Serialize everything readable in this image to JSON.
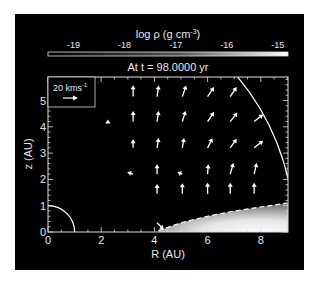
{
  "chart_data": {
    "type": "heatmap",
    "title": "At t = 98.0000 yr",
    "colorbar": {
      "label": "log ρ (g cm⁻³)",
      "label_base": "log ρ (g cm",
      "label_exp": "-3",
      "label_close": ")",
      "ticks": [
        "-19",
        "-18",
        "-17",
        "-16",
        "-15"
      ],
      "range": [
        -19.5,
        -14.8
      ],
      "colormap": "grayscale (black to white)"
    },
    "xlabel": "R (AU)",
    "ylabel": "z (AU)",
    "xlim": [
      0,
      9
    ],
    "ylim": [
      0,
      5.9
    ],
    "xticks": [
      "0",
      "2",
      "4",
      "6",
      "8"
    ],
    "yticks": [
      "0",
      "1",
      "2",
      "3",
      "4",
      "5"
    ],
    "velocity_key": {
      "label": "20 kms",
      "label_exp": "-1",
      "speed_kms": 20
    },
    "overlays": [
      {
        "type": "arc",
        "radius_au": 1.0,
        "style": "solid",
        "color": "#ffffff"
      },
      {
        "type": "arc",
        "radius_au": 9.25,
        "style": "solid",
        "color": "#ffffff"
      },
      {
        "type": "disk-surface",
        "style": "dashed",
        "points_au": [
          [
            4.15,
            0.05
          ],
          [
            5,
            0.35
          ],
          [
            6,
            0.6
          ],
          [
            7,
            0.8
          ],
          [
            8,
            0.95
          ],
          [
            9,
            1.1
          ]
        ]
      }
    ],
    "vectors_au": [
      {
        "R": 2.25,
        "z": 4.15,
        "dR": 0.0,
        "dz": 0.05
      },
      {
        "R": 3.2,
        "z": 5.15,
        "dR": 0.0,
        "dz": 0.35
      },
      {
        "R": 4.1,
        "z": 5.15,
        "dR": 0.05,
        "dz": 0.35
      },
      {
        "R": 5.05,
        "z": 5.15,
        "dR": 0.12,
        "dz": 0.35
      },
      {
        "R": 6.0,
        "z": 5.15,
        "dR": 0.2,
        "dz": 0.3
      },
      {
        "R": 6.85,
        "z": 5.15,
        "dR": 0.2,
        "dz": 0.3
      },
      {
        "R": 3.2,
        "z": 4.2,
        "dR": 0.0,
        "dz": 0.32
      },
      {
        "R": 4.1,
        "z": 4.2,
        "dR": 0.05,
        "dz": 0.33
      },
      {
        "R": 5.05,
        "z": 4.2,
        "dR": 0.1,
        "dz": 0.33
      },
      {
        "R": 6.0,
        "z": 4.2,
        "dR": 0.2,
        "dz": 0.3
      },
      {
        "R": 6.85,
        "z": 4.2,
        "dR": 0.22,
        "dz": 0.28
      },
      {
        "R": 7.75,
        "z": 4.2,
        "dR": 0.28,
        "dz": 0.22
      },
      {
        "R": 3.2,
        "z": 3.2,
        "dR": 0.0,
        "dz": 0.25
      },
      {
        "R": 4.1,
        "z": 3.2,
        "dR": 0.05,
        "dz": 0.3
      },
      {
        "R": 5.05,
        "z": 3.2,
        "dR": 0.05,
        "dz": 0.3
      },
      {
        "R": 6.0,
        "z": 3.2,
        "dR": 0.15,
        "dz": 0.3
      },
      {
        "R": 6.85,
        "z": 3.2,
        "dR": 0.2,
        "dz": 0.28
      },
      {
        "R": 7.75,
        "z": 3.2,
        "dR": 0.28,
        "dz": 0.22
      },
      {
        "R": 3.2,
        "z": 2.2,
        "dR": -0.15,
        "dz": 0.05
      },
      {
        "R": 4.1,
        "z": 2.2,
        "dR": 0.0,
        "dz": 0.3
      },
      {
        "R": 5.05,
        "z": 2.2,
        "dR": -0.12,
        "dz": 0.05
      },
      {
        "R": 6.0,
        "z": 2.2,
        "dR": 0.02,
        "dz": 0.3
      },
      {
        "R": 6.85,
        "z": 2.2,
        "dR": 0.1,
        "dz": 0.35
      },
      {
        "R": 7.75,
        "z": 2.2,
        "dR": 0.08,
        "dz": 0.35
      },
      {
        "R": 4.1,
        "z": 1.45,
        "dR": 0.0,
        "dz": 0.3
      },
      {
        "R": 5.05,
        "z": 1.45,
        "dR": 0.0,
        "dz": 0.33
      },
      {
        "R": 6.0,
        "z": 1.45,
        "dR": 0.0,
        "dz": 0.35
      },
      {
        "R": 6.85,
        "z": 1.45,
        "dR": 0.0,
        "dz": 0.35
      },
      {
        "R": 7.75,
        "z": 1.45,
        "dR": 0.0,
        "dz": 0.35
      },
      {
        "R": 4.1,
        "z": 0.35,
        "dR": 0.2,
        "dz": -0.2
      }
    ]
  },
  "colors": {
    "background": "#000000",
    "foreground": "#e8e8e8",
    "page": "#ffffff"
  }
}
